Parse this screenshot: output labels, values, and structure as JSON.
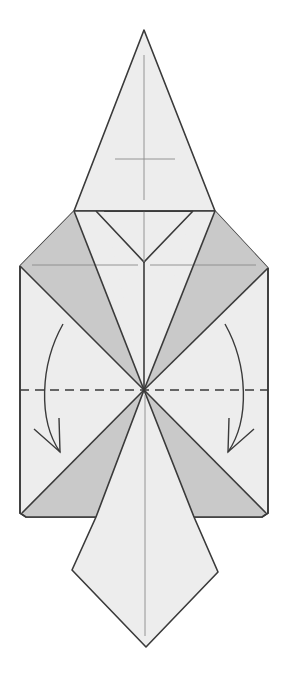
{
  "diagram": {
    "type": "origami-fold-step",
    "colors": {
      "background": "#ffffff",
      "paper_light": "#ededed",
      "paper_shade": "#c9c9c9",
      "outline": "#3a3a3a",
      "crease": "#7a7a7a"
    },
    "shapes": {
      "hat": "144,30 74,211 215,211",
      "body": "20,266 74,211 215,211 268,268 268,513 262,517 26,517 20,513",
      "left_upper_flap": "74,211 20,266 144,390",
      "right_upper_flap": "215,211 268,268 144,390",
      "left_upper_shade": "74,211 20,266 144,390 104,211",
      "left_upper_shade2": "74,211 20,266 144,390",
      "right_upper_shade": "215,211 268,268 144,390",
      "left_lower_shade": "144,390 20,513 26,517 96,517",
      "right_lower_shade": "144,390 268,513 262,517 194,517",
      "tie": "144,390 96,517 72,570 146,647 218,572 194,517"
    },
    "fold_lines": {
      "dashed_horizontal": {
        "y": 390,
        "x1": 20,
        "x2": 268
      },
      "arrows": [
        "left-valley-fold-arrow",
        "right-valley-fold-arrow"
      ]
    }
  }
}
